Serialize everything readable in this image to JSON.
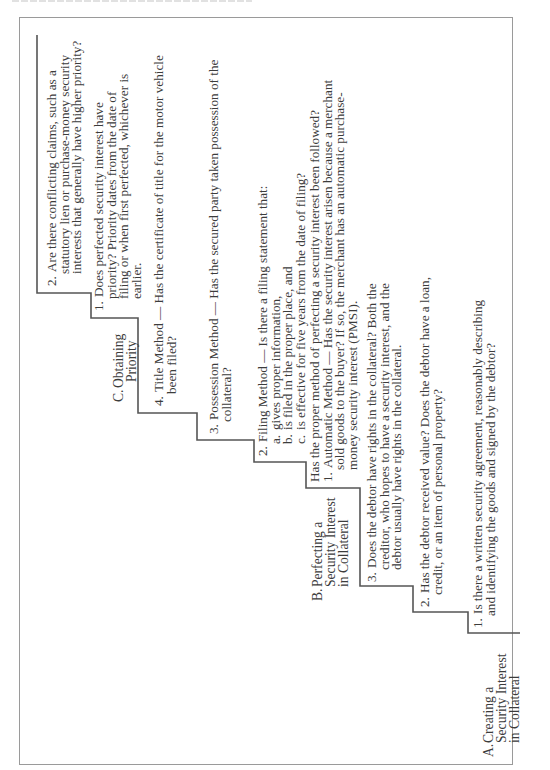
{
  "document": {
    "header_partial": "",
    "orientation": "rotated-90-ccw",
    "sections": {
      "A": {
        "label": "A.",
        "title_lines": [
          "Creating a",
          "Security Interest",
          "in Collateral"
        ],
        "steps": [
          {
            "num": "1.",
            "lines": [
              "Is there a written security agreement, reasonably describing",
              "and identifying the goods and signed by the debtor?"
            ]
          },
          {
            "num": "2.",
            "lines": [
              "Has the debtor received value? Does the debtor have a loan,",
              "credit, or an item of personal property?"
            ]
          },
          {
            "num": "3.",
            "lines": [
              "Does the debtor have rights in the collateral? Both the",
              "creditor, who hopes to have a security interest, and the",
              "debtor usually have rights in the collateral."
            ]
          }
        ]
      },
      "B": {
        "label": "B.",
        "title_lines": [
          "Perfecting a",
          "Security Interest",
          "in Collateral"
        ],
        "intro": "Has the proper method of perfecting a security interest been followed?",
        "steps": [
          {
            "num": "1.",
            "lines": [
              "Automatic Method — Has the security interest arisen because a merchant",
              "sold goods to the buyer?  If so, the merchant has an automatic purchase-",
              "money security interest (PMSI)."
            ]
          },
          {
            "num": "2.",
            "lines": [
              "Filing Method — Is there a filing statement that:"
            ],
            "sub": [
              {
                "letter": "a.",
                "text": "gives proper information,"
              },
              {
                "letter": "b.",
                "text": "is filed in the proper place, and"
              },
              {
                "letter": "c.",
                "text": "is effective for five years from the date of filing?"
              }
            ]
          },
          {
            "num": "3.",
            "lines": [
              "Possession Method — Has the secured party taken possession of the",
              "collateral?"
            ]
          },
          {
            "num": "4.",
            "lines": [
              "Title Method — Has the certificate of title for the motor vehicle",
              "been filed?"
            ]
          }
        ]
      },
      "C": {
        "label": "C.",
        "title_lines": [
          "Obtaining",
          "Priority"
        ],
        "steps": [
          {
            "num": "1.",
            "lines": [
              "Does perfected security interest have",
              "priority? Priority dates from the date of",
              "filing or when first perfected, whichever is",
              "earlier."
            ]
          },
          {
            "num": "2.",
            "lines": [
              "Are there conflicting claims, such as a",
              "statutory lien or purchase-money security",
              "interests that generally have higher priority?"
            ]
          }
        ]
      }
    },
    "colors": {
      "stair_line": "#555555",
      "frame_border": "#9a9a9a",
      "text": "#3c3c3c"
    }
  }
}
